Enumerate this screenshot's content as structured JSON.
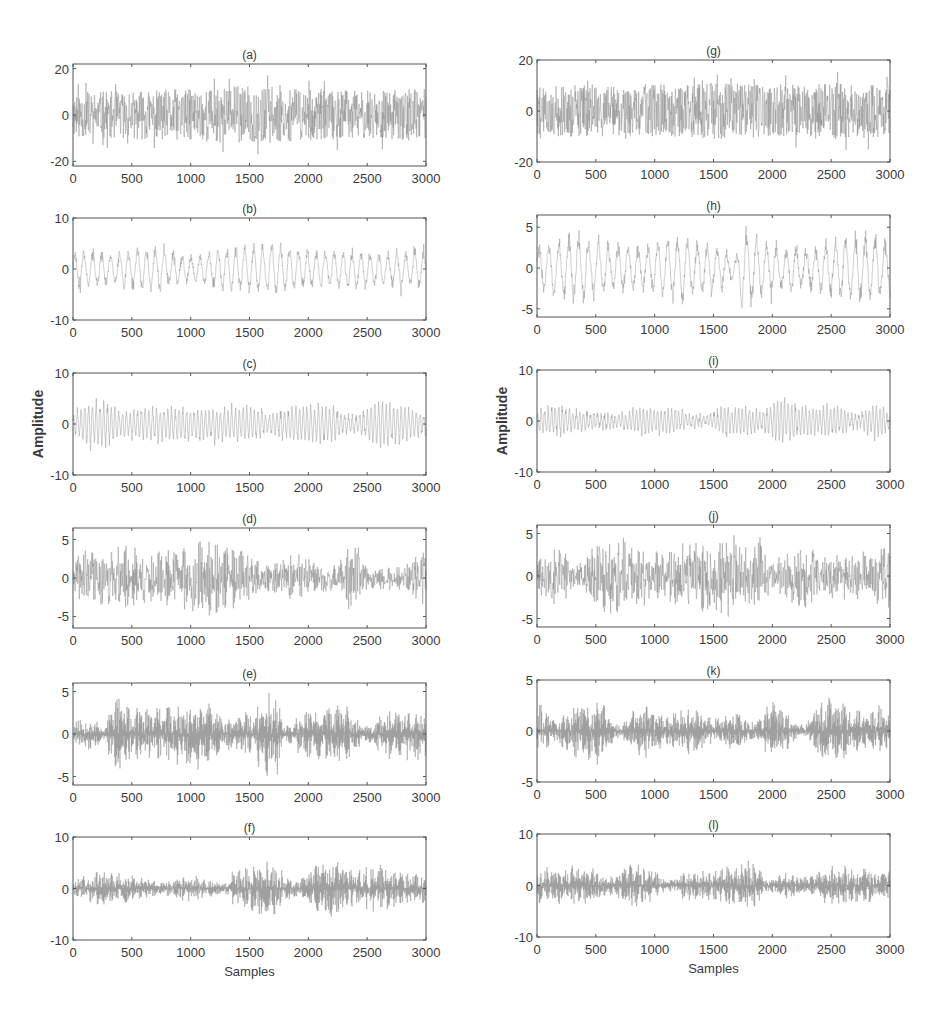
{
  "figure": {
    "width": 945,
    "height": 1021,
    "line_color": "#8a8a8a",
    "axis_color": "#555555",
    "ylabel": "Amplitude",
    "xlabel": "Samples"
  },
  "chart_data": [
    {
      "id": "a",
      "type": "line",
      "title": "(a)",
      "xlabel": "",
      "ylabel": "",
      "xlim": [
        0,
        3000
      ],
      "ylim": [
        -22,
        22
      ],
      "yticks": [
        -20,
        0,
        20
      ],
      "xticks": [
        0,
        500,
        1000,
        1500,
        2000,
        2500,
        3000
      ],
      "grid": false,
      "box": [
        73,
        64,
        426,
        166
      ],
      "style": "noise",
      "amp": 14,
      "peak": 20,
      "seed": 11,
      "envelope": [
        [
          0,
          0.7
        ],
        [
          500,
          0.75
        ],
        [
          1000,
          0.8
        ],
        [
          1500,
          0.9
        ],
        [
          2000,
          0.8
        ],
        [
          2500,
          0.75
        ],
        [
          3000,
          0.8
        ]
      ]
    },
    {
      "id": "b",
      "type": "line",
      "title": "(b)",
      "xlabel": "",
      "ylabel": "",
      "xlim": [
        0,
        3000
      ],
      "ylim": [
        -10,
        10
      ],
      "yticks": [
        -10,
        0,
        10
      ],
      "xticks": [
        0,
        500,
        1000,
        1500,
        2000,
        2500,
        3000
      ],
      "grid": false,
      "box": [
        73,
        218,
        426,
        320
      ],
      "style": "osc",
      "amp": 5,
      "peak": 7.5,
      "period": 38,
      "seed": 23,
      "envelope": [
        [
          0,
          0.8
        ],
        [
          300,
          0.7
        ],
        [
          600,
          0.9
        ],
        [
          1000,
          0.6
        ],
        [
          1450,
          1.0
        ],
        [
          1700,
          1.1
        ],
        [
          2000,
          0.8
        ],
        [
          2400,
          0.8
        ],
        [
          2700,
          0.7
        ],
        [
          3000,
          0.9
        ]
      ]
    },
    {
      "id": "c",
      "type": "line",
      "title": "(c)",
      "xlabel": "",
      "ylabel": "Amplitude",
      "xlim": [
        0,
        3000
      ],
      "ylim": [
        -10,
        10
      ],
      "yticks": [
        -10,
        0,
        10
      ],
      "xticks": [
        0,
        500,
        1000,
        1500,
        2000,
        2500,
        3000
      ],
      "grid": false,
      "box": [
        73,
        373,
        426,
        475
      ],
      "style": "osc",
      "amp": 4,
      "peak": 6.5,
      "period": 16,
      "seed": 37,
      "envelope": [
        [
          0,
          0.6
        ],
        [
          150,
          1.2
        ],
        [
          300,
          1.1
        ],
        [
          400,
          0.6
        ],
        [
          700,
          0.9
        ],
        [
          1000,
          0.9
        ],
        [
          1200,
          0.8
        ],
        [
          1500,
          0.9
        ],
        [
          1700,
          0.6
        ],
        [
          1900,
          0.9
        ],
        [
          2150,
          1.0
        ],
        [
          2400,
          0.4
        ],
        [
          2600,
          1.3
        ],
        [
          2700,
          1.1
        ],
        [
          3000,
          0.6
        ]
      ]
    },
    {
      "id": "d",
      "type": "line",
      "title": "(d)",
      "xlabel": "",
      "ylabel": "",
      "xlim": [
        0,
        3000
      ],
      "ylim": [
        -6.5,
        6.5
      ],
      "yticks": [
        -5,
        0,
        5
      ],
      "xticks": [
        0,
        500,
        1000,
        1500,
        2000,
        2500,
        3000
      ],
      "grid": false,
      "box": [
        73,
        528,
        426,
        628
      ],
      "style": "bursts",
      "amp": 4,
      "peak": 6,
      "burst": 70,
      "seed": 41,
      "envelope": [
        [
          0,
          0.5
        ],
        [
          100,
          1.2
        ],
        [
          200,
          0.9
        ],
        [
          460,
          1.1
        ],
        [
          700,
          0.9
        ],
        [
          1000,
          1.1
        ],
        [
          1080,
          1.4
        ],
        [
          1300,
          1.2
        ],
        [
          1500,
          1.0
        ],
        [
          1600,
          0.5
        ],
        [
          1900,
          0.8
        ],
        [
          2200,
          0.5
        ],
        [
          2400,
          1.2
        ],
        [
          2500,
          0.4
        ],
        [
          2800,
          0.4
        ],
        [
          2950,
          0.9
        ],
        [
          3000,
          0.8
        ]
      ]
    },
    {
      "id": "e",
      "type": "line",
      "title": "(e)",
      "xlabel": "",
      "ylabel": "",
      "xlim": [
        0,
        3000
      ],
      "ylim": [
        -6,
        6
      ],
      "yticks": [
        -5,
        0,
        5
      ],
      "xticks": [
        0,
        500,
        1000,
        1500,
        2000,
        2500,
        3000
      ],
      "grid": false,
      "box": [
        73,
        683,
        426,
        785
      ],
      "style": "bursts-dense",
      "amp": 3.5,
      "peak": 6,
      "burst": 85,
      "seed": 53,
      "envelope": [
        [
          0,
          0.5
        ],
        [
          130,
          0.7
        ],
        [
          250,
          0.3
        ],
        [
          380,
          1.5
        ],
        [
          480,
          0.9
        ],
        [
          700,
          0.9
        ],
        [
          1000,
          1.2
        ],
        [
          1100,
          1.2
        ],
        [
          1300,
          0.6
        ],
        [
          1500,
          0.9
        ],
        [
          1720,
          1.7
        ],
        [
          1800,
          0.3
        ],
        [
          2000,
          0.9
        ],
        [
          2270,
          1.1
        ],
        [
          2500,
          0.3
        ],
        [
          2700,
          0.9
        ],
        [
          2900,
          1.0
        ],
        [
          3000,
          1.0
        ]
      ]
    },
    {
      "id": "f",
      "type": "line",
      "title": "(f)",
      "xlabel": "Samples",
      "ylabel": "",
      "xlim": [
        0,
        3000
      ],
      "ylim": [
        -10,
        10
      ],
      "yticks": [
        -10,
        0,
        10
      ],
      "xticks": [
        0,
        500,
        1000,
        1500,
        2000,
        2500,
        3000
      ],
      "grid": false,
      "box": [
        73,
        837,
        426,
        940
      ],
      "style": "bursts-dense",
      "amp": 3.5,
      "peak": 7,
      "burst": 60,
      "seed": 67,
      "envelope": [
        [
          0,
          0.6
        ],
        [
          200,
          1.0
        ],
        [
          500,
          0.8
        ],
        [
          750,
          0.4
        ],
        [
          1000,
          0.8
        ],
        [
          1250,
          0.4
        ],
        [
          1400,
          1.1
        ],
        [
          1650,
          1.6
        ],
        [
          1900,
          0.5
        ],
        [
          2150,
          1.7
        ],
        [
          2400,
          1.2
        ],
        [
          2600,
          1.4
        ],
        [
          2800,
          1.0
        ],
        [
          3000,
          0.9
        ]
      ]
    },
    {
      "id": "g",
      "type": "line",
      "title": "(g)",
      "xlabel": "",
      "ylabel": "",
      "xlim": [
        0,
        3000
      ],
      "ylim": [
        -20,
        20
      ],
      "yticks": [
        -20,
        0,
        20
      ],
      "xticks": [
        0,
        500,
        1000,
        1500,
        2000,
        2500,
        3000
      ],
      "grid": false,
      "box": [
        537,
        60,
        890,
        162
      ],
      "style": "noise",
      "amp": 13,
      "peak": 19,
      "seed": 79,
      "envelope": [
        [
          0,
          0.75
        ],
        [
          500,
          0.8
        ],
        [
          1000,
          0.8
        ],
        [
          1500,
          0.85
        ],
        [
          2000,
          0.8
        ],
        [
          2500,
          0.85
        ],
        [
          3000,
          0.8
        ]
      ]
    },
    {
      "id": "h",
      "type": "line",
      "title": "(h)",
      "xlabel": "",
      "ylabel": "",
      "xlim": [
        0,
        3000
      ],
      "ylim": [
        -6,
        6.5
      ],
      "yticks": [
        -5,
        0,
        5
      ],
      "xticks": [
        0,
        500,
        1000,
        1500,
        2000,
        2500,
        3000
      ],
      "grid": false,
      "box": [
        537,
        215,
        890,
        317
      ],
      "style": "osc",
      "amp": 4,
      "peak": 6.5,
      "period": 42,
      "seed": 83,
      "envelope": [
        [
          0,
          0.7
        ],
        [
          300,
          1.1
        ],
        [
          600,
          0.8
        ],
        [
          900,
          0.7
        ],
        [
          1200,
          1.1
        ],
        [
          1500,
          0.8
        ],
        [
          1700,
          0.4
        ],
        [
          1750,
          1.4
        ],
        [
          2000,
          0.8
        ],
        [
          2300,
          0.7
        ],
        [
          2700,
          1.1
        ],
        [
          3000,
          1.0
        ]
      ]
    },
    {
      "id": "i",
      "type": "line",
      "title": "(i)",
      "xlabel": "",
      "ylabel": "Amplitude",
      "xlim": [
        0,
        3000
      ],
      "ylim": [
        -10,
        10
      ],
      "yticks": [
        -10,
        0,
        10
      ],
      "xticks": [
        0,
        500,
        1000,
        1500,
        2000,
        2500,
        3000
      ],
      "grid": false,
      "box": [
        537,
        370,
        890,
        472
      ],
      "style": "osc",
      "amp": 3,
      "peak": 7,
      "period": 15,
      "seed": 97,
      "envelope": [
        [
          0,
          0.8
        ],
        [
          200,
          1.0
        ],
        [
          400,
          0.6
        ],
        [
          700,
          0.5
        ],
        [
          900,
          1.0
        ],
        [
          1100,
          0.9
        ],
        [
          1400,
          0.4
        ],
        [
          1660,
          1.1
        ],
        [
          1900,
          0.7
        ],
        [
          2100,
          1.6
        ],
        [
          2300,
          0.9
        ],
        [
          2500,
          1.1
        ],
        [
          2700,
          0.5
        ],
        [
          2900,
          1.3
        ],
        [
          3000,
          0.5
        ]
      ]
    },
    {
      "id": "j",
      "type": "line",
      "title": "(j)",
      "xlabel": "",
      "ylabel": "",
      "xlim": [
        0,
        3000
      ],
      "ylim": [
        -6,
        6
      ],
      "yticks": [
        -5,
        0,
        5
      ],
      "xticks": [
        0,
        500,
        1000,
        1500,
        2000,
        2500,
        3000
      ],
      "grid": false,
      "box": [
        537,
        525,
        890,
        627
      ],
      "style": "bursts",
      "amp": 3.5,
      "peak": 5.5,
      "burst": 55,
      "seed": 101,
      "envelope": [
        [
          0,
          0.7
        ],
        [
          150,
          1.0
        ],
        [
          350,
          0.5
        ],
        [
          480,
          1.4
        ],
        [
          750,
          1.4
        ],
        [
          1000,
          0.9
        ],
        [
          1300,
          1.2
        ],
        [
          1600,
          1.4
        ],
        [
          1870,
          1.4
        ],
        [
          2000,
          0.6
        ],
        [
          2250,
          1.1
        ],
        [
          2500,
          0.8
        ],
        [
          2800,
          0.9
        ],
        [
          2950,
          1.3
        ],
        [
          3000,
          1.2
        ]
      ]
    },
    {
      "id": "k",
      "type": "line",
      "title": "(k)",
      "xlabel": "",
      "ylabel": "",
      "xlim": [
        0,
        3000
      ],
      "ylim": [
        -5,
        5
      ],
      "yticks": [
        -5,
        0,
        5
      ],
      "xticks": [
        0,
        500,
        1000,
        1500,
        2000,
        2500,
        3000
      ],
      "grid": false,
      "box": [
        537,
        680,
        890,
        782
      ],
      "style": "bursts-dense",
      "amp": 2.5,
      "peak": 3.8,
      "burst": 60,
      "seed": 113,
      "envelope": [
        [
          0,
          1.1
        ],
        [
          150,
          0.5
        ],
        [
          330,
          1.2
        ],
        [
          500,
          1.4
        ],
        [
          700,
          0.3
        ],
        [
          880,
          1.1
        ],
        [
          1100,
          0.7
        ],
        [
          1350,
          1.0
        ],
        [
          1500,
          0.6
        ],
        [
          1700,
          0.8
        ],
        [
          1850,
          0.4
        ],
        [
          2000,
          1.2
        ],
        [
          2250,
          0.3
        ],
        [
          2470,
          1.5
        ],
        [
          2600,
          1.2
        ],
        [
          2800,
          0.8
        ],
        [
          2930,
          1.1
        ],
        [
          3000,
          0.8
        ]
      ]
    },
    {
      "id": "l",
      "type": "line",
      "title": "(l)",
      "xlabel": "Samples",
      "ylabel": "",
      "xlim": [
        0,
        3000
      ],
      "ylim": [
        -10,
        10
      ],
      "yticks": [
        -10,
        0,
        10
      ],
      "xticks": [
        0,
        500,
        1000,
        1500,
        2000,
        2500,
        3000
      ],
      "grid": false,
      "box": [
        537,
        834,
        890,
        937
      ],
      "style": "bursts-dense",
      "amp": 3,
      "peak": 6.5,
      "burst": 55,
      "seed": 127,
      "envelope": [
        [
          0,
          1.2
        ],
        [
          200,
          1.3
        ],
        [
          400,
          1.4
        ],
        [
          600,
          0.7
        ],
        [
          850,
          1.5
        ],
        [
          1000,
          1.0
        ],
        [
          1100,
          0.4
        ],
        [
          1300,
          1.0
        ],
        [
          1500,
          1.0
        ],
        [
          1770,
          1.8
        ],
        [
          2000,
          0.5
        ],
        [
          2100,
          0.9
        ],
        [
          2300,
          0.6
        ],
        [
          2500,
          1.4
        ],
        [
          2800,
          1.2
        ],
        [
          3000,
          1.0
        ]
      ]
    }
  ]
}
